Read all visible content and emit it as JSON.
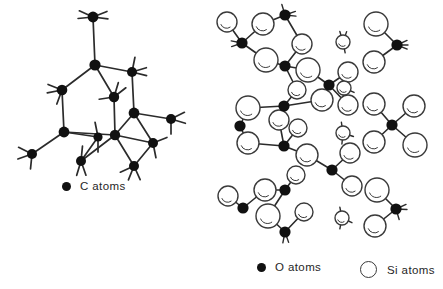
{
  "figure": {
    "colors": {
      "atom_dark": "#111111",
      "atom_open_fill": "#ffffff",
      "atom_open_stroke": "#3a3a3a",
      "bond": "#2b2b2b",
      "background": "#ffffff",
      "text": "#262626"
    }
  },
  "panels": [
    {
      "id": "carbon-network",
      "name": "carbon-structure-panel",
      "legend": {
        "marker": "filled-circle-marker",
        "label": "C atoms"
      }
    },
    {
      "id": "silica-network",
      "name": "silica-structure-panel",
      "legend_oxygen": {
        "marker": "filled-circle-marker",
        "label": "O atoms"
      },
      "legend_silicon": {
        "marker": "open-circle-marker",
        "label": "Si atoms"
      }
    }
  ],
  "chart_data": {
    "type": "diagram",
    "subtitle": "",
    "xlabel": "",
    "ylabel": "",
    "legend_position": "bottom",
    "grid": false,
    "structures": [
      {
        "name": "carbon-network",
        "description": "Tetrahedrally bonded carbon network drawn in perspective with a central six-membered ring",
        "atom_type": "C",
        "atom_count": 14,
        "atoms": [
          {
            "id": "c1",
            "x": 93,
            "y": 17,
            "r": 5.4
          },
          {
            "id": "c2",
            "x": 95,
            "y": 65,
            "r": 5.6
          },
          {
            "id": "c3",
            "x": 132,
            "y": 72,
            "r": 5.0
          },
          {
            "id": "c4",
            "x": 62,
            "y": 90,
            "r": 5.3
          },
          {
            "id": "c5",
            "x": 114,
            "y": 97,
            "r": 5.2
          },
          {
            "id": "c6",
            "x": 134,
            "y": 113,
            "r": 5.4
          },
          {
            "id": "c7",
            "x": 171,
            "y": 119,
            "r": 5.0
          },
          {
            "id": "c8",
            "x": 64,
            "y": 132,
            "r": 5.4
          },
          {
            "id": "c9",
            "x": 98,
            "y": 137,
            "r": 4.6
          },
          {
            "id": "c10",
            "x": 115,
            "y": 135,
            "r": 5.2
          },
          {
            "id": "c11",
            "x": 153,
            "y": 143,
            "r": 5.0
          },
          {
            "id": "c12",
            "x": 32,
            "y": 154,
            "r": 5.0
          },
          {
            "id": "c13",
            "x": 81,
            "y": 161,
            "r": 5.0
          },
          {
            "id": "c14",
            "x": 134,
            "y": 166,
            "r": 5.0
          }
        ],
        "bonds": [
          [
            "c1",
            "c2"
          ],
          [
            "c2",
            "c3"
          ],
          [
            "c2",
            "c4"
          ],
          [
            "c2",
            "c5"
          ],
          [
            "c3",
            "c6"
          ],
          [
            "c5",
            "c10"
          ],
          [
            "c4",
            "c8"
          ],
          [
            "c6",
            "c7"
          ],
          [
            "c6",
            "c10"
          ],
          [
            "c6",
            "c11"
          ],
          [
            "c8",
            "c9"
          ],
          [
            "c8",
            "c10"
          ],
          [
            "c8",
            "c12"
          ],
          [
            "c9",
            "c13"
          ],
          [
            "c10",
            "c11"
          ],
          [
            "c10",
            "c14"
          ],
          [
            "c11",
            "c14"
          ],
          [
            "c13",
            "c10"
          ]
        ],
        "stub_bonds": [
          {
            "at": "c1",
            "dirs": [
              [
                -1,
                -0.45
              ],
              [
                -1,
                0.1
              ],
              [
                1,
                -0.4
              ],
              [
                1,
                0.12
              ]
            ]
          },
          {
            "at": "c3",
            "dirs": [
              [
                0.2,
                -1
              ],
              [
                1,
                -0.3
              ],
              [
                1,
                0.25
              ]
            ]
          },
          {
            "at": "c4",
            "dirs": [
              [
                -1,
                -0.4
              ],
              [
                -1,
                0.2
              ],
              [
                -0.35,
                0.95
              ]
            ]
          },
          {
            "at": "c5",
            "dirs": [
              [
                -1,
                0.15
              ],
              [
                0.9,
                -0.7
              ],
              [
                0.3,
                -1
              ]
            ]
          },
          {
            "at": "c7",
            "dirs": [
              [
                1,
                -0.5
              ],
              [
                1,
                0.3
              ],
              [
                0,
                1
              ]
            ]
          },
          {
            "at": "c9",
            "dirs": [
              [
                -0.2,
                -1
              ],
              [
                0,
                1
              ]
            ]
          },
          {
            "at": "c11",
            "dirs": [
              [
                1,
                -0.4
              ],
              [
                0.2,
                1
              ]
            ]
          },
          {
            "at": "c12",
            "dirs": [
              [
                -1,
                -0.5
              ],
              [
                -1,
                0.35
              ],
              [
                -0.1,
                1
              ]
            ]
          },
          {
            "at": "c13",
            "dirs": [
              [
                -0.3,
                1
              ],
              [
                0.35,
                1
              ],
              [
                0.1,
                -1
              ]
            ]
          },
          {
            "at": "c14",
            "dirs": [
              [
                -1,
                0.45
              ],
              [
                -0.4,
                1
              ],
              [
                0.45,
                1
              ]
            ]
          }
        ]
      },
      {
        "name": "silica-network",
        "description": "Silica network: small filled oxygen atoms bonded to large open silicon circles, forming a connected branch at left and isolated clusters at right separated by a vertical column of single silicon atoms",
        "oxygen_label": "O",
        "silicon_label": "Si",
        "oxygen_count": 14,
        "silicon_count": 33,
        "oxygen_radius": 5.6,
        "silicon_radius_large": 11.0,
        "silicon_radius_small": 7.0,
        "oxygen_atoms": [
          {
            "id": "o1",
            "x": 20,
            "y": 43
          },
          {
            "id": "o2",
            "x": 63,
            "y": 15
          },
          {
            "id": "o3",
            "x": 63,
            "y": 66
          },
          {
            "id": "o4",
            "x": 107,
            "y": 85
          },
          {
            "id": "o5",
            "x": 62,
            "y": 106
          },
          {
            "id": "o6",
            "x": 18,
            "y": 126
          },
          {
            "id": "o7",
            "x": 62,
            "y": 146
          },
          {
            "id": "o8",
            "x": 110,
            "y": 170
          },
          {
            "id": "o9",
            "x": 63,
            "y": 190
          },
          {
            "id": "o10",
            "x": 21,
            "y": 208
          },
          {
            "id": "o11",
            "x": 63,
            "y": 232
          },
          {
            "id": "o12",
            "x": 175,
            "y": 45
          },
          {
            "id": "o13",
            "x": 170,
            "y": 125
          },
          {
            "id": "o14",
            "x": 174,
            "y": 209
          }
        ],
        "silicon_atoms": [
          {
            "id": "s1",
            "x": 41,
            "y": 24,
            "r": 11
          },
          {
            "id": "s2",
            "x": 44,
            "y": 60,
            "r": 12
          },
          {
            "id": "s3",
            "x": 5,
            "y": 22,
            "r": 10
          },
          {
            "id": "s4",
            "x": 80,
            "y": 44,
            "r": 10
          },
          {
            "id": "s5",
            "x": 86,
            "y": 70,
            "r": 12
          },
          {
            "id": "s6",
            "x": 126,
            "y": 72,
            "r": 10
          },
          {
            "id": "s7",
            "x": 75,
            "y": 90,
            "r": 9
          },
          {
            "id": "s8",
            "x": 100,
            "y": 100,
            "r": 11
          },
          {
            "id": "s9",
            "x": 126,
            "y": 105,
            "r": 10
          },
          {
            "id": "s10",
            "x": 26,
            "y": 108,
            "r": 12
          },
          {
            "id": "s11",
            "x": 57,
            "y": 120,
            "r": 10
          },
          {
            "id": "s12",
            "x": 26,
            "y": 143,
            "r": 11
          },
          {
            "id": "s13",
            "x": 76,
            "y": 128,
            "r": 9
          },
          {
            "id": "s14",
            "x": 85,
            "y": 155,
            "r": 11
          },
          {
            "id": "s15",
            "x": 128,
            "y": 153,
            "r": 10
          },
          {
            "id": "s16",
            "x": 130,
            "y": 186,
            "r": 10
          },
          {
            "id": "s17",
            "x": 74,
            "y": 175,
            "r": 9
          },
          {
            "id": "s18",
            "x": 43,
            "y": 190,
            "r": 11
          },
          {
            "id": "s19",
            "x": 46,
            "y": 216,
            "r": 12
          },
          {
            "id": "s20",
            "x": 6,
            "y": 196,
            "r": 10
          },
          {
            "id": "s21",
            "x": 82,
            "y": 212,
            "r": 9
          },
          {
            "id": "s22",
            "x": 154,
            "y": 24,
            "r": 12
          },
          {
            "id": "s23",
            "x": 152,
            "y": 62,
            "r": 11
          },
          {
            "id": "s24",
            "x": 152,
            "y": 104,
            "r": 11
          },
          {
            "id": "s25",
            "x": 192,
            "y": 106,
            "r": 11
          },
          {
            "id": "s26",
            "x": 152,
            "y": 142,
            "r": 11
          },
          {
            "id": "s27",
            "x": 193,
            "y": 145,
            "r": 12
          },
          {
            "id": "s28",
            "x": 155,
            "y": 190,
            "r": 12
          },
          {
            "id": "s29",
            "x": 153,
            "y": 226,
            "r": 11
          },
          {
            "id": "s30",
            "x": 121,
            "y": 42,
            "r": 7
          },
          {
            "id": "s31",
            "x": 122,
            "y": 88,
            "r": 7
          },
          {
            "id": "s32",
            "x": 121,
            "y": 133,
            "r": 7
          },
          {
            "id": "s33",
            "x": 120,
            "y": 218,
            "r": 7
          }
        ],
        "bonds": [
          [
            "o1",
            "s3"
          ],
          [
            "o1",
            "s1"
          ],
          [
            "o1",
            "s2"
          ],
          [
            "o2",
            "s1"
          ],
          [
            "o2",
            "s4"
          ],
          [
            "o3",
            "s2"
          ],
          [
            "o3",
            "s4"
          ],
          [
            "o3",
            "s5"
          ],
          [
            "o3",
            "s7"
          ],
          [
            "o4",
            "s5"
          ],
          [
            "o4",
            "s6"
          ],
          [
            "o4",
            "s9"
          ],
          [
            "o5",
            "s7"
          ],
          [
            "o5",
            "s8"
          ],
          [
            "o5",
            "s10"
          ],
          [
            "o5",
            "s11"
          ],
          [
            "o6",
            "s10"
          ],
          [
            "o6",
            "s12"
          ],
          [
            "o7",
            "s11"
          ],
          [
            "o7",
            "s12"
          ],
          [
            "o7",
            "s13"
          ],
          [
            "o7",
            "s14"
          ],
          [
            "o8",
            "s14"
          ],
          [
            "o8",
            "s15"
          ],
          [
            "o8",
            "s16"
          ],
          [
            "o9",
            "s17"
          ],
          [
            "o9",
            "s18"
          ],
          [
            "o9",
            "s19"
          ],
          [
            "o10",
            "s20"
          ],
          [
            "o10",
            "s18"
          ],
          [
            "o11",
            "s19"
          ],
          [
            "o11",
            "s21"
          ],
          [
            "o12",
            "s22"
          ],
          [
            "o12",
            "s23"
          ],
          [
            "o13",
            "s24"
          ],
          [
            "o13",
            "s25"
          ],
          [
            "o13",
            "s26"
          ],
          [
            "o13",
            "s27"
          ],
          [
            "o14",
            "s28"
          ],
          [
            "o14",
            "s29"
          ]
        ],
        "stub_bonds": [
          {
            "at": "o1",
            "dirs": [
              [
                -1,
                -0.2
              ],
              [
                -1,
                0.35
              ]
            ]
          },
          {
            "at": "o2",
            "dirs": [
              [
                -0.3,
                -1
              ],
              [
                1,
                -0.35
              ],
              [
                1,
                0.1
              ]
            ]
          },
          {
            "at": "o12",
            "dirs": [
              [
                1,
                -0.45
              ],
              [
                1,
                0.0
              ],
              [
                1,
                0.4
              ]
            ]
          },
          {
            "at": "o14",
            "dirs": [
              [
                1,
                -0.45
              ],
              [
                1,
                0.05
              ],
              [
                0.3,
                1
              ]
            ]
          },
          {
            "at": "o11",
            "dirs": [
              [
                -0.2,
                1
              ],
              [
                0.35,
                1
              ]
            ]
          },
          {
            "at": "s30",
            "dirs": [
              [
                -0.3,
                -1
              ],
              [
                0.35,
                -1
              ],
              [
                0.2,
                1
              ]
            ]
          },
          {
            "at": "s31",
            "dirs": [
              [
                -0.2,
                -1
              ],
              [
                -0.1,
                1
              ],
              [
                0.9,
                0.4
              ]
            ]
          },
          {
            "at": "s32",
            "dirs": [
              [
                -0.15,
                -1
              ],
              [
                -0.1,
                1
              ],
              [
                0.9,
                0.3
              ]
            ]
          },
          {
            "at": "s33",
            "dirs": [
              [
                -0.2,
                -1
              ],
              [
                -0.2,
                1
              ],
              [
                0.85,
                0.4
              ]
            ]
          }
        ]
      }
    ]
  }
}
